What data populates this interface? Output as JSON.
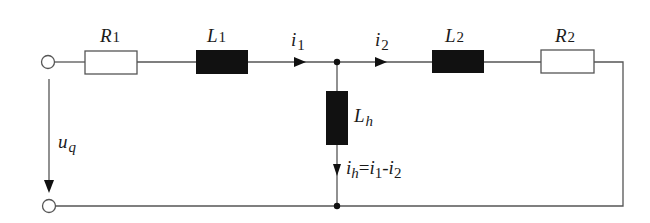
{
  "diagram": {
    "type": "circuit",
    "colors": {
      "wire": "#555555",
      "inductor": "#111111",
      "resistor_fill": "#ffffff",
      "text": "#1a1a1a"
    },
    "components": {
      "R1": {
        "name": "R",
        "sub": "1"
      },
      "L1": {
        "name": "L",
        "sub": "1"
      },
      "L2": {
        "name": "L",
        "sub": "2"
      },
      "R2": {
        "name": "R",
        "sub": "2"
      },
      "Lh": {
        "name": "L",
        "sub": "h"
      }
    },
    "currents": {
      "i1": {
        "name": "i",
        "sub": "1"
      },
      "i2": {
        "name": "i",
        "sub": "2"
      },
      "ih": {
        "name": "i",
        "sub": "h",
        "eq": "=",
        "t1": "i",
        "t1sub": "1",
        "minus": "-",
        "t2": "i",
        "t2sub": "2"
      }
    },
    "voltage": {
      "uq": {
        "name": "u",
        "sub": "q"
      }
    }
  }
}
